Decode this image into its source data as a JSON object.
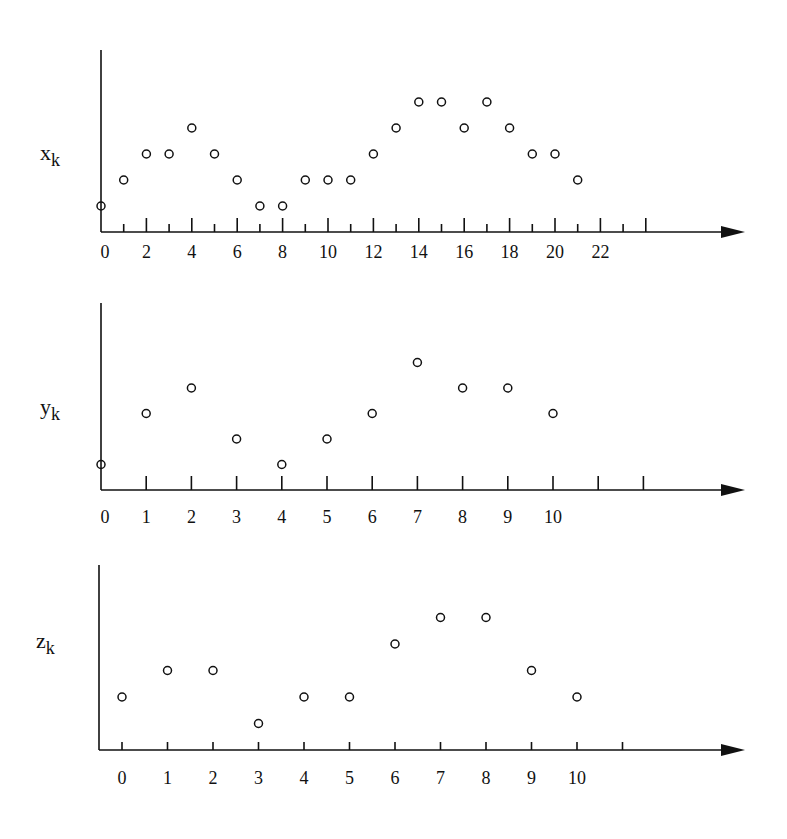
{
  "chart_data": [
    {
      "type": "scatter",
      "title": "",
      "ylabel": "x",
      "ylabel_sub": "k",
      "xlabel": "",
      "x": [
        0,
        1,
        2,
        3,
        4,
        5,
        6,
        7,
        8,
        9,
        10,
        11,
        12,
        13,
        14,
        15,
        16,
        17,
        18,
        19,
        20,
        21
      ],
      "values": [
        1,
        2,
        3,
        3,
        4,
        3,
        2,
        1,
        1,
        2,
        2,
        2,
        3,
        4,
        5,
        5,
        4,
        5,
        4,
        3,
        3,
        2
      ],
      "tick_labels": [
        "0",
        "2",
        "4",
        "6",
        "8",
        "10",
        "12",
        "14",
        "16",
        "18",
        "20",
        "22"
      ],
      "tick_label_positions": [
        0,
        2,
        4,
        6,
        8,
        10,
        12,
        14,
        16,
        18,
        20,
        22
      ],
      "ticks": [
        1,
        2,
        3,
        4,
        5,
        6,
        7,
        8,
        9,
        10,
        11,
        12,
        13,
        14,
        15,
        16,
        17,
        18,
        19,
        20,
        21,
        22,
        23,
        24
      ],
      "xlim": [
        0,
        27.5
      ],
      "ylim": [
        0,
        7
      ],
      "grid": false,
      "marker": "open-circle"
    },
    {
      "type": "scatter",
      "title": "",
      "ylabel": "y",
      "ylabel_sub": "k",
      "xlabel": "",
      "x": [
        0,
        1,
        2,
        3,
        4,
        5,
        6,
        7,
        8,
        9,
        10
      ],
      "values": [
        1,
        3,
        4,
        2,
        1,
        2,
        3,
        5,
        4,
        4,
        3
      ],
      "tick_labels": [
        "0",
        "1",
        "2",
        "3",
        "4",
        "5",
        "6",
        "7",
        "8",
        "9",
        "10"
      ],
      "tick_label_positions": [
        0,
        1,
        2,
        3,
        4,
        5,
        6,
        7,
        8,
        9,
        10
      ],
      "ticks": [
        1,
        2,
        3,
        4,
        5,
        6,
        7,
        8,
        9,
        10,
        11,
        12
      ],
      "xlim": [
        0,
        14
      ],
      "ylim": [
        0,
        7
      ],
      "grid": false,
      "marker": "open-circle"
    },
    {
      "type": "scatter",
      "title": "",
      "ylabel": "z",
      "ylabel_sub": "k",
      "xlabel": "",
      "x": [
        0,
        1,
        2,
        3,
        4,
        5,
        6,
        7,
        8,
        9,
        10
      ],
      "values": [
        2,
        3,
        3,
        1,
        2,
        2,
        4,
        5,
        5,
        3,
        2
      ],
      "tick_labels": [
        "0",
        "1",
        "2",
        "3",
        "4",
        "5",
        "6",
        "7",
        "8",
        "9",
        "10"
      ],
      "tick_label_positions": [
        0,
        1,
        2,
        3,
        4,
        5,
        6,
        7,
        8,
        9,
        10
      ],
      "ticks": [
        0,
        1,
        2,
        3,
        4,
        5,
        6,
        7,
        8,
        9,
        10,
        11
      ],
      "xlim": [
        -0.5,
        13.5
      ],
      "ylim": [
        0,
        7
      ],
      "grid": false,
      "marker": "open-circle"
    }
  ],
  "layout": [
    {
      "axis_x": 101,
      "axis_top": 50,
      "baseline": 232,
      "x0": 101,
      "unit": 22.7,
      "level": 26,
      "arrow_end": 745,
      "label_x": 40,
      "label_y": 160,
      "tick_label_y": 258,
      "major_h": 14,
      "minor_h": 8,
      "mixed": true
    },
    {
      "axis_x": 101,
      "axis_top": 303,
      "baseline": 490,
      "x0": 101,
      "unit": 45.2,
      "level": 25.5,
      "arrow_end": 745,
      "label_x": 40,
      "label_y": 414,
      "tick_label_y": 523,
      "major_h": 14,
      "minor_h": 14,
      "mixed": false
    },
    {
      "axis_x": 99,
      "axis_top": 565,
      "baseline": 750,
      "x0": 122,
      "unit": 45.5,
      "level": 26.5,
      "arrow_end": 745,
      "label_x": 36,
      "label_y": 648,
      "tick_label_y": 784,
      "major_h": 8,
      "minor_h": 8,
      "mixed": false
    }
  ],
  "colors": {
    "ink": "#111111",
    "background": "#ffffff"
  }
}
